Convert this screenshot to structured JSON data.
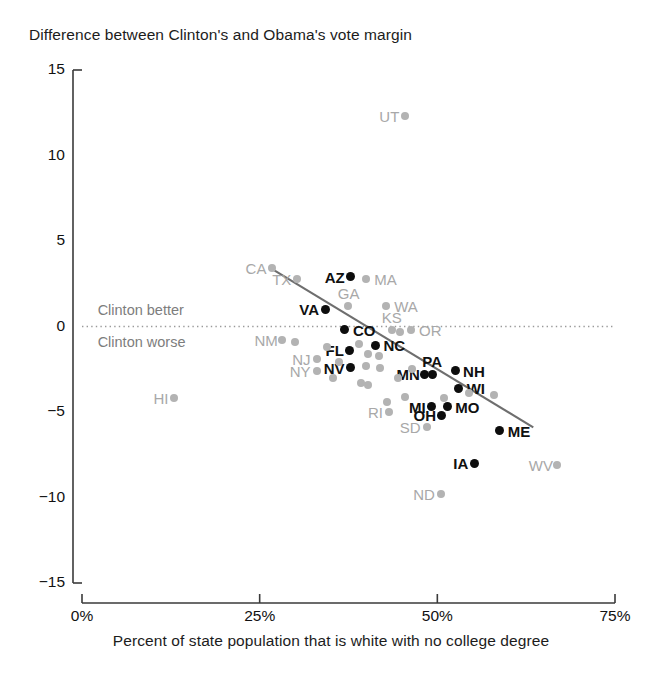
{
  "chart_data": {
    "type": "scatter",
    "title": "Difference between Clinton's and Obama's vote margin",
    "xlabel": "Percent of state population that is white with no college degree",
    "ylabel": "",
    "xlim": [
      0,
      75
    ],
    "ylim": [
      -15,
      15
    ],
    "xticks": [
      "0%",
      "25%",
      "50%",
      "75%"
    ],
    "xtick_values": [
      0,
      25,
      50,
      75
    ],
    "yticks": [
      "15",
      "10",
      "5",
      "0",
      "-5",
      "-10",
      "-15"
    ],
    "ytick_values": [
      15,
      10,
      5,
      0,
      -5,
      -10,
      -15
    ],
    "grid": false,
    "zero_reference_line": true,
    "legend": null,
    "annotations": [
      {
        "text": "Clinton better",
        "x": 2.2,
        "y": 0.9
      },
      {
        "text": "Clinton worse",
        "x": 2.2,
        "y": -0.95
      }
    ],
    "trendline": {
      "x0": 26.6,
      "y0": 3.4,
      "x1": 63.5,
      "y1": -5.9
    },
    "series": [
      {
        "name": "Highlighted states",
        "color": "#0d0d0d",
        "points": [
          {
            "label": "AZ",
            "x": 37.8,
            "y": 2.9,
            "label_side": "left"
          },
          {
            "label": "VA",
            "x": 34.2,
            "y": 1.0,
            "label_side": "left"
          },
          {
            "label": "CO",
            "x": 37.0,
            "y": -0.2,
            "label_side": "right"
          },
          {
            "label": "NC",
            "x": 41.3,
            "y": -1.1,
            "label_side": "right"
          },
          {
            "label": "FL",
            "x": 37.7,
            "y": -1.4,
            "label_side": "left"
          },
          {
            "label": "NV",
            "x": 37.8,
            "y": -2.4,
            "label_side": "left"
          },
          {
            "label": "MN",
            "x": 48.2,
            "y": -2.8,
            "label_side": "left"
          },
          {
            "label": "PA",
            "x": 49.3,
            "y": -2.8,
            "label_side": "above"
          },
          {
            "label": "NH",
            "x": 52.5,
            "y": -2.6,
            "label_side": "right"
          },
          {
            "label": "WI",
            "x": 53.0,
            "y": -3.6,
            "label_side": "right"
          },
          {
            "label": "MI",
            "x": 49.2,
            "y": -4.7,
            "label_side": "left"
          },
          {
            "label": "MO",
            "x": 51.4,
            "y": -4.7,
            "label_side": "right"
          },
          {
            "label": "OH",
            "x": 50.6,
            "y": -5.2,
            "label_side": "left"
          },
          {
            "label": "ME",
            "x": 58.8,
            "y": -6.1,
            "label_side": "right"
          },
          {
            "label": "IA",
            "x": 55.2,
            "y": -8.0,
            "label_side": "left"
          }
        ]
      },
      {
        "name": "Other states",
        "color": "#b3b3b3",
        "points": [
          {
            "label": "UT",
            "x": 45.5,
            "y": 12.3,
            "label_side": "left"
          },
          {
            "label": "CA",
            "x": 26.8,
            "y": 3.4,
            "label_side": "left"
          },
          {
            "label": "TX",
            "x": 30.3,
            "y": 2.8,
            "label_side": "left"
          },
          {
            "label": "MA",
            "x": 40.0,
            "y": 2.8,
            "label_side": "right"
          },
          {
            "label": "GA",
            "x": 37.4,
            "y": 1.2,
            "label_side": "above"
          },
          {
            "label": "WA",
            "x": 42.8,
            "y": 1.2,
            "label_side": "right"
          },
          {
            "label": "KS",
            "x": 43.6,
            "y": -0.2,
            "label_side": "above"
          },
          {
            "label": "OR",
            "x": 46.3,
            "y": -0.2,
            "label_side": "right"
          },
          {
            "label": "NM",
            "x": 28.2,
            "y": -0.8,
            "label_side": "left"
          },
          {
            "label": "NJ",
            "x": 33.0,
            "y": -1.9,
            "label_side": "left"
          },
          {
            "label": "NY",
            "x": 33.0,
            "y": -2.6,
            "label_side": "left"
          },
          {
            "label": "HI",
            "x": 13.0,
            "y": -4.2,
            "label_side": "left"
          },
          {
            "label": "RI",
            "x": 43.2,
            "y": -5.0,
            "label_side": "left"
          },
          {
            "label": "SD",
            "x": 48.5,
            "y": -5.9,
            "label_side": "left"
          },
          {
            "label": "WV",
            "x": 66.8,
            "y": -8.1,
            "label_side": "left"
          },
          {
            "label": "ND",
            "x": 50.5,
            "y": -9.8,
            "label_side": "left"
          }
        ]
      },
      {
        "name": "Unlabeled states",
        "color": "#b3b3b3",
        "points": [
          {
            "label": "",
            "x": 30.0,
            "y": -0.9
          },
          {
            "label": "",
            "x": 34.5,
            "y": -1.2
          },
          {
            "label": "",
            "x": 39.0,
            "y": -1.0
          },
          {
            "label": "",
            "x": 40.2,
            "y": -1.6
          },
          {
            "label": "",
            "x": 41.8,
            "y": -1.7
          },
          {
            "label": "",
            "x": 44.8,
            "y": -0.3
          },
          {
            "label": "",
            "x": 36.2,
            "y": -2.1
          },
          {
            "label": "",
            "x": 39.9,
            "y": -2.3
          },
          {
            "label": "",
            "x": 42.0,
            "y": -2.4
          },
          {
            "label": "",
            "x": 35.3,
            "y": -3.0
          },
          {
            "label": "",
            "x": 39.2,
            "y": -3.3
          },
          {
            "label": "",
            "x": 40.2,
            "y": -3.4
          },
          {
            "label": "",
            "x": 44.5,
            "y": -3.0
          },
          {
            "label": "",
            "x": 46.4,
            "y": -2.5
          },
          {
            "label": "",
            "x": 54.5,
            "y": -3.9
          },
          {
            "label": "",
            "x": 51.0,
            "y": -4.2
          },
          {
            "label": "",
            "x": 58.0,
            "y": -4.0
          },
          {
            "label": "",
            "x": 45.5,
            "y": -4.1
          },
          {
            "label": "",
            "x": 42.9,
            "y": -4.4
          }
        ]
      }
    ]
  }
}
